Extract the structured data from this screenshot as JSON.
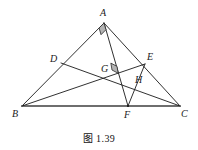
{
  "figure": {
    "caption": "图 1.39",
    "caption_x": 0,
    "caption_y": 130,
    "width": 198,
    "height": 150,
    "background_color": "#ffffff",
    "stroke_color": "#1a1a1a",
    "base_stroke_color": "#6e6e6e",
    "right_angle_fill": "#b4b4b4",
    "right_angle_stroke": "#2a2a2a",
    "labels": [
      {
        "id": "A",
        "text": "A",
        "x": 100,
        "y": 8
      },
      {
        "id": "D",
        "text": "D",
        "x": 50,
        "y": 54
      },
      {
        "id": "E",
        "text": "E",
        "x": 147,
        "y": 52
      },
      {
        "id": "G",
        "text": "G",
        "x": 101,
        "y": 64
      },
      {
        "id": "H",
        "text": "H",
        "x": 135,
        "y": 75
      },
      {
        "id": "B",
        "text": "B",
        "x": 12,
        "y": 109
      },
      {
        "id": "F",
        "text": "F",
        "x": 124,
        "y": 110
      },
      {
        "id": "C",
        "text": "C",
        "x": 181,
        "y": 109
      }
    ],
    "points": {
      "A": {
        "x": 104,
        "y": 23
      },
      "B": {
        "x": 22,
        "y": 106
      },
      "C": {
        "x": 180,
        "y": 106
      },
      "D": {
        "x": 61,
        "y": 63
      },
      "E": {
        "x": 145,
        "y": 64
      },
      "F": {
        "x": 128,
        "y": 106
      },
      "G": {
        "x": 112,
        "y": 70
      },
      "H": {
        "x": 133,
        "y": 83
      }
    },
    "segments": [
      {
        "id": "AB",
        "from": "A",
        "to": "B",
        "style": "thin"
      },
      {
        "id": "AC",
        "from": "A",
        "to": "C",
        "style": "thin"
      },
      {
        "id": "BC",
        "from": "B",
        "to": "C",
        "style": "base"
      },
      {
        "id": "AF",
        "from": "A",
        "to": "F",
        "style": "thin"
      },
      {
        "id": "BE",
        "from": "B",
        "to": "E",
        "style": "thin"
      },
      {
        "id": "DC",
        "from": "D",
        "to": "C",
        "style": "thin"
      },
      {
        "id": "EF",
        "from": "E",
        "to": "F",
        "style": "thin"
      }
    ],
    "right_angles": [
      {
        "id": "angle-at-A",
        "vertex": "A",
        "arm1": "B",
        "arm2": "F",
        "size": 7
      },
      {
        "id": "angle-at-G",
        "vertex": "G",
        "arm1": "C",
        "arm2": "A",
        "size": 7
      }
    ]
  }
}
